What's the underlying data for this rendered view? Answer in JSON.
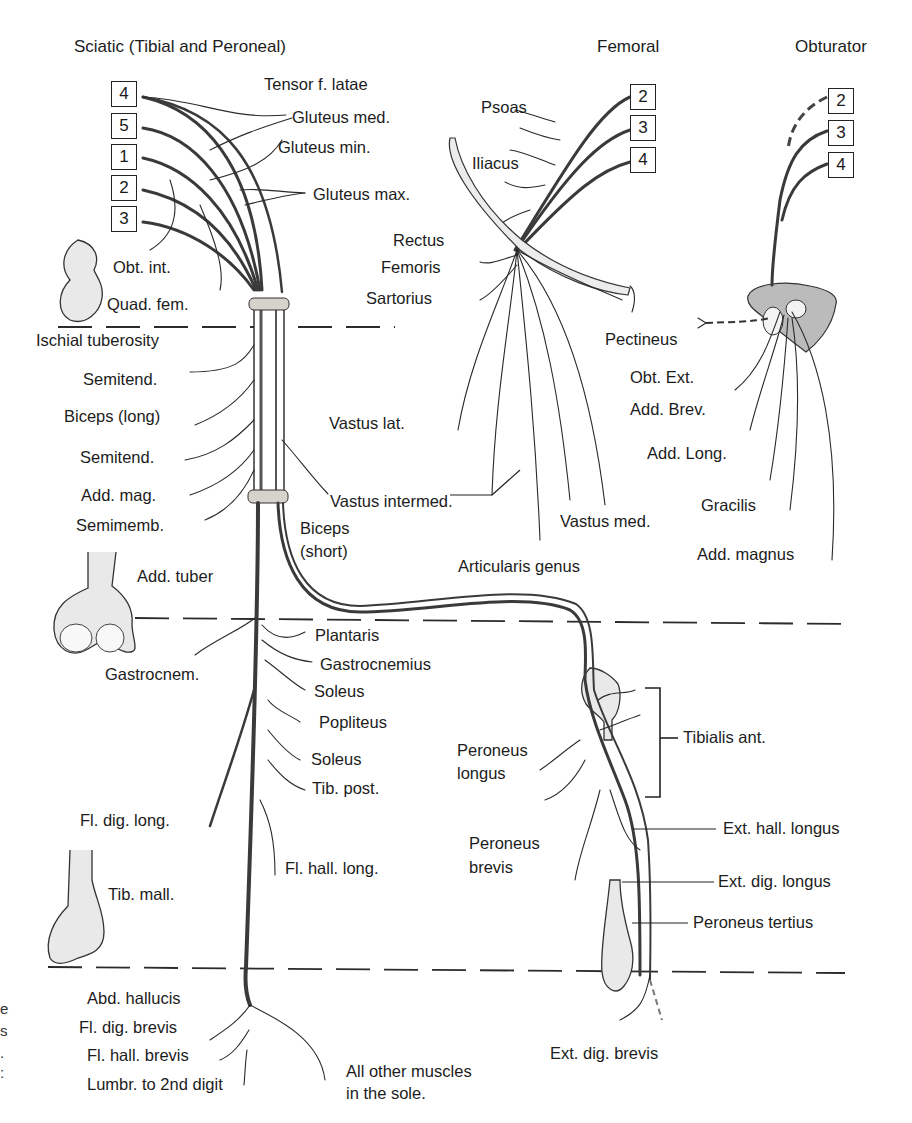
{
  "headers": {
    "sciatic": "Sciatic (Tibial and Peroneal)",
    "femoral": "Femoral",
    "obturator": "Obturator"
  },
  "root_boxes": {
    "sciatic": [
      "4",
      "5",
      "1",
      "2",
      "3"
    ],
    "femoral": [
      "2",
      "3",
      "4"
    ],
    "obturator": [
      "2",
      "3",
      "4"
    ]
  },
  "sciatic_labels": {
    "tensor_f_latae": "Tensor f. latae",
    "gluteus_med": "Gluteus med.",
    "gluteus_min": "Gluteus min.",
    "gluteus_max": "Gluteus max.",
    "obt_int": "Obt. int.",
    "quad_fem": "Quad. fem.",
    "ischial_tuberosity": "Ischial tuberosity",
    "semitend_1": "Semitend.",
    "biceps_long": "Biceps (long)",
    "semitend_2": "Semitend.",
    "add_mag": "Add. mag.",
    "semimemb": "Semimemb.",
    "biceps_short_1": "Biceps",
    "biceps_short_2": "(short)",
    "add_tuber": "Add. tuber",
    "gastrocnem": "Gastrocnem.",
    "plantaris": "Plantaris",
    "gastrocnemius": "Gastrocnemius",
    "soleus_1": "Soleus",
    "popliteus": "Popliteus",
    "soleus_2": "Soleus",
    "tib_post": "Tib. post.",
    "fl_dig_long": "Fl. dig. long.",
    "fl_hall_long": "Fl. hall. long.",
    "tib_mall": "Tib. mall.",
    "abd_hallucis": "Abd. hallucis",
    "fl_dig_brevis": "Fl. dig. brevis",
    "fl_hall_brevis": "Fl. hall. brevis",
    "lumbr": "Lumbr. to 2nd digit",
    "all_other_1": "All other muscles",
    "all_other_2": "in the sole."
  },
  "peroneal_labels": {
    "tibialis_ant": "Tibialis ant.",
    "peroneus_longus_1": "Peroneus",
    "peroneus_longus_2": "longus",
    "peroneus_brevis_1": "Peroneus",
    "peroneus_brevis_2": "brevis",
    "ext_hall_longus": "Ext. hall. longus",
    "ext_dig_longus": "Ext. dig. longus",
    "peroneus_tertius": "Peroneus tertius",
    "ext_dig_brevis": "Ext. dig. brevis"
  },
  "femoral_labels": {
    "psoas": "Psoas",
    "iliacus": "Iliacus",
    "rectus": "Rectus",
    "femoris": "Femoris",
    "sartorius": "Sartorius",
    "vastus_lat": "Vastus lat.",
    "vastus_intermed": "Vastus intermed.",
    "vastus_med": "Vastus med.",
    "articularis_genus": "Articularis genus",
    "pectineus": "Pectineus"
  },
  "obturator_labels": {
    "obt_ext": "Obt. Ext.",
    "add_brev": "Add. Brev.",
    "add_long": "Add. Long.",
    "gracilis": "Gracilis",
    "add_magnus": "Add. magnus"
  },
  "left_edge_cutoff": [
    "e",
    "s",
    ".",
    ":"
  ]
}
